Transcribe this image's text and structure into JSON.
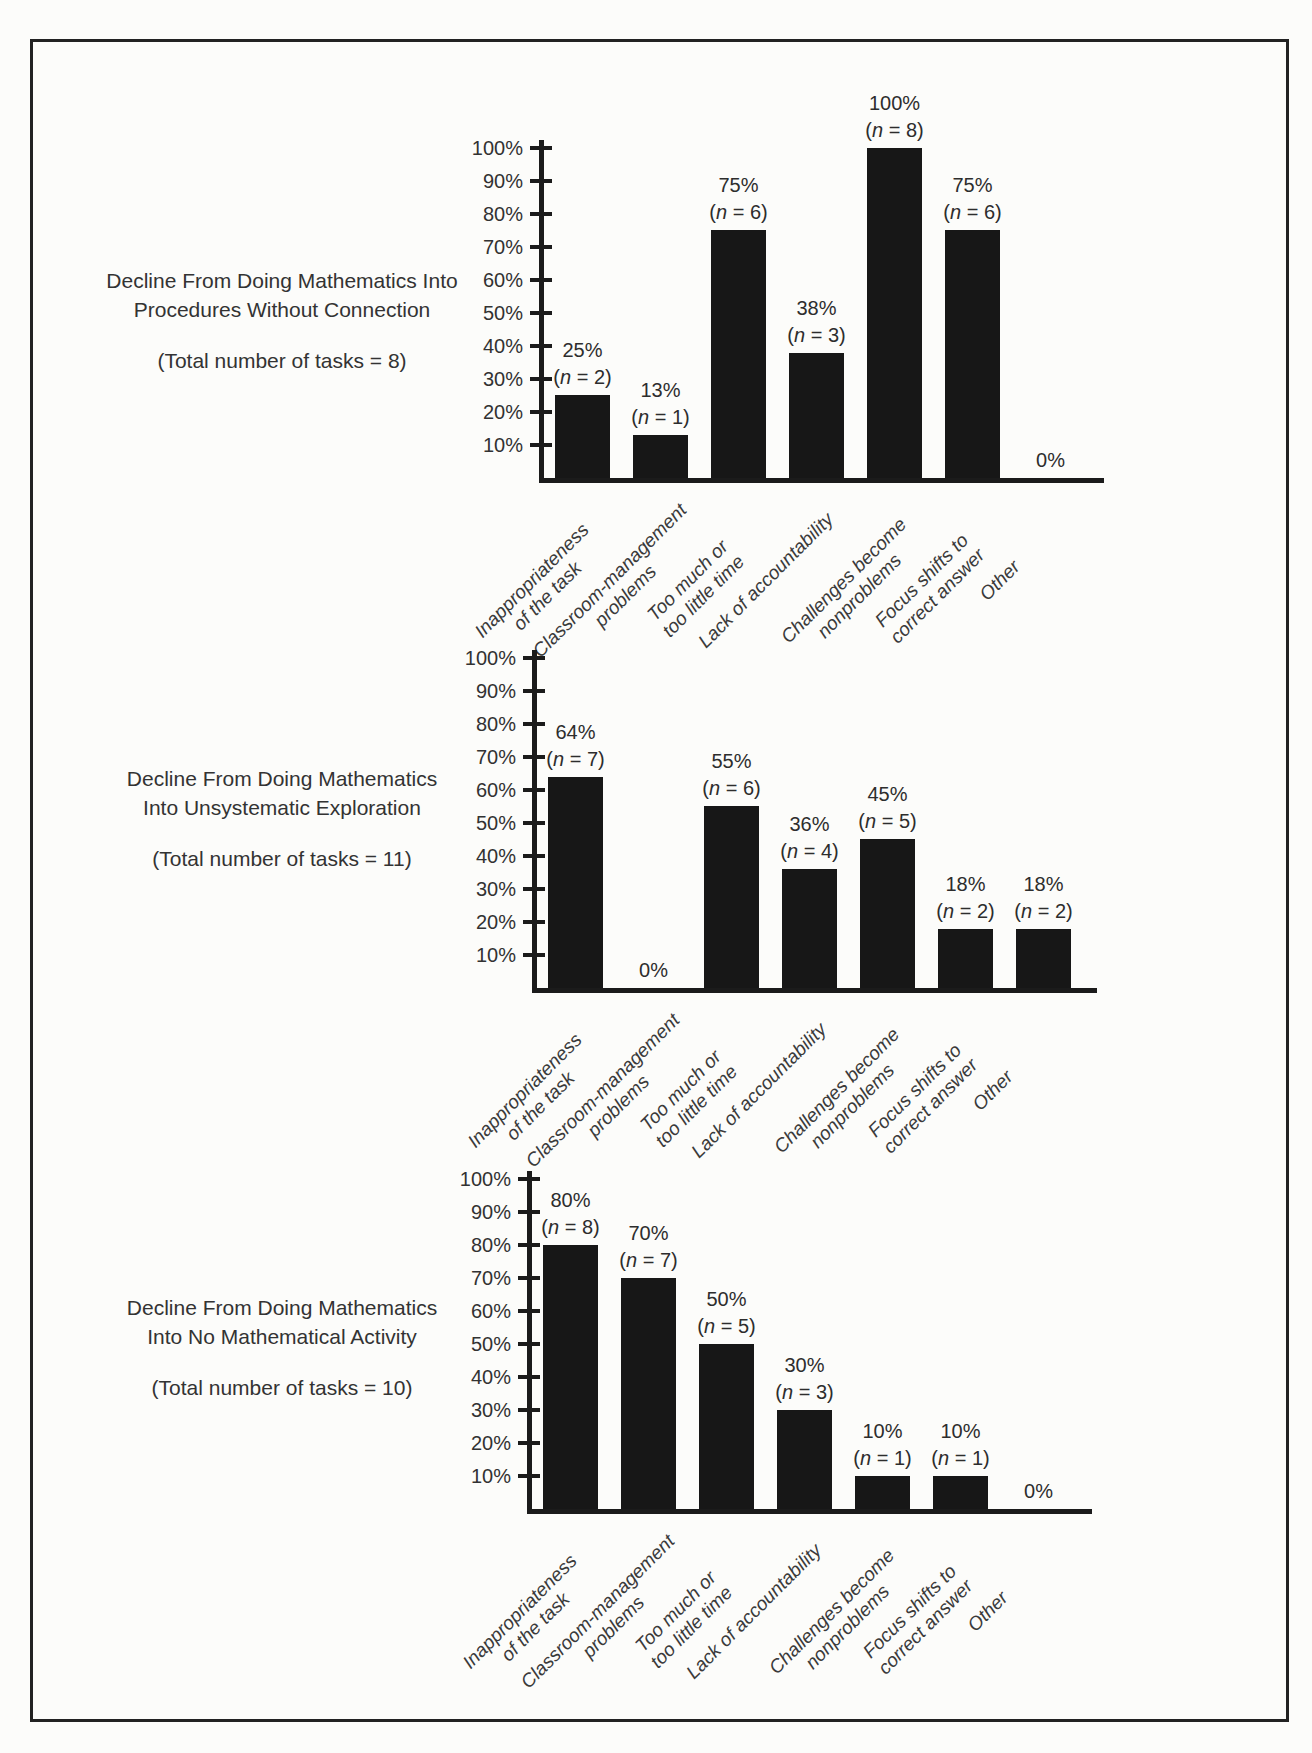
{
  "figure": {
    "background": "#fcfcfa",
    "border_color": "#222222",
    "bar_color": "#171717",
    "text_color": "#2e2e2e",
    "y_axis_tick_labels": [
      "100%",
      "90%",
      "80%",
      "70%",
      "60%",
      "50%",
      "40%",
      "30%",
      "20%",
      "10%"
    ]
  },
  "chart_data": [
    {
      "type": "bar",
      "title_lines": [
        "Decline From Doing Mathematics Into",
        "Procedures Without Connection"
      ],
      "total_label": "(Total number of tasks = 8)",
      "total_tasks": 8,
      "ylim": [
        0,
        100
      ],
      "ytick_step": 10,
      "grid": false,
      "categories": [
        "Inappropriateness of the task",
        "Classroom-management problems",
        "Too much or too little time",
        "Lack of accountability",
        "Challenges become nonproblems",
        "Focus shifts to correct answer",
        "Other"
      ],
      "category_label_lines": [
        [
          "Inappropriateness",
          "of the task"
        ],
        [
          "Classroom-management",
          "problems"
        ],
        [
          "Too much or",
          "too little time"
        ],
        [
          "Lack of accountability"
        ],
        [
          "Challenges become",
          "nonproblems"
        ],
        [
          "Focus shifts to",
          "correct answer"
        ],
        [
          "Other"
        ]
      ],
      "values": [
        25,
        13,
        75,
        38,
        100,
        75,
        0
      ],
      "counts": [
        2,
        1,
        6,
        3,
        8,
        6,
        0
      ],
      "value_labels": [
        "25%",
        "13%",
        "75%",
        "38%",
        "100%",
        "75%",
        "0%"
      ],
      "count_labels": [
        "(n = 2)",
        "(n = 1)",
        "(n = 6)",
        "(n = 3)",
        "(n = 8)",
        "(n = 6)",
        ""
      ]
    },
    {
      "type": "bar",
      "title_lines": [
        "Decline From Doing Mathematics",
        "Into Unsystematic Exploration"
      ],
      "total_label": "(Total number of tasks = 11)",
      "total_tasks": 11,
      "ylim": [
        0,
        100
      ],
      "ytick_step": 10,
      "grid": false,
      "categories": [
        "Inappropriateness of the task",
        "Classroom-management problems",
        "Too much or too little time",
        "Lack of accountability",
        "Challenges become nonproblems",
        "Focus shifts to correct answer",
        "Other"
      ],
      "category_label_lines": [
        [
          "Inappropriateness",
          "of the task"
        ],
        [
          "Classroom-management",
          "problems"
        ],
        [
          "Too much or",
          "too little time"
        ],
        [
          "Lack of accountability"
        ],
        [
          "Challenges become",
          "nonproblems"
        ],
        [
          "Focus shifts to",
          "correct answer"
        ],
        [
          "Other"
        ]
      ],
      "values": [
        64,
        0,
        55,
        36,
        45,
        18,
        18
      ],
      "counts": [
        7,
        0,
        6,
        4,
        5,
        2,
        2
      ],
      "value_labels": [
        "64%",
        "0%",
        "55%",
        "36%",
        "45%",
        "18%",
        "18%"
      ],
      "count_labels": [
        "(n = 7)",
        "",
        "(n = 6)",
        "(n = 4)",
        "(n = 5)",
        "(n = 2)",
        "(n = 2)"
      ]
    },
    {
      "type": "bar",
      "title_lines": [
        "Decline From Doing Mathematics",
        "Into No Mathematical Activity"
      ],
      "total_label": "(Total number of tasks = 10)",
      "total_tasks": 10,
      "ylim": [
        0,
        100
      ],
      "ytick_step": 10,
      "grid": false,
      "categories": [
        "Inappropriateness of the task",
        "Classroom-management problems",
        "Too much or too little time",
        "Lack of accountability",
        "Challenges become nonproblems",
        "Focus shifts to correct answer",
        "Other"
      ],
      "category_label_lines": [
        [
          "Inappropriateness",
          "of the task"
        ],
        [
          "Classroom-management",
          "problems"
        ],
        [
          "Too much or",
          "too little time"
        ],
        [
          "Lack of accountability"
        ],
        [
          "Challenges become",
          "nonproblems"
        ],
        [
          "Focus shifts to",
          "correct answer"
        ],
        [
          "Other"
        ]
      ],
      "values": [
        80,
        70,
        50,
        30,
        10,
        10,
        0
      ],
      "counts": [
        8,
        7,
        5,
        3,
        1,
        1,
        0
      ],
      "value_labels": [
        "80%",
        "70%",
        "50%",
        "30%",
        "10%",
        "10%",
        "0%"
      ],
      "count_labels": [
        "(n = 8)",
        "(n = 7)",
        "(n = 5)",
        "(n = 3)",
        "(n = 1)",
        "(n = 1)",
        ""
      ]
    }
  ]
}
